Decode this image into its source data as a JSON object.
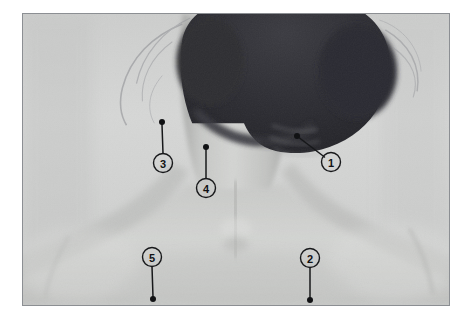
{
  "figure": {
    "kind": "anatomy-photo",
    "frame": {
      "x": 22,
      "y": 13,
      "width": 428,
      "height": 293,
      "border_color": "#8c8f93"
    },
    "background_color": "#ffffff"
  },
  "photo": {
    "name": "posterior-neck-shoulders",
    "palette": {
      "skin_light": "#d8d9d8",
      "skin_mid": "#c6c7c6",
      "skin_shadow": "#a9aaa9",
      "hair_dark": "#2a2a2e",
      "hair_mid": "#44444a",
      "background_wall": "#d4d5d4",
      "marker_ink": "#111214"
    }
  },
  "markers": [
    {
      "id": "marker-1",
      "label": "1",
      "circle": {
        "cx": 331,
        "cy": 162,
        "r": 9.5
      },
      "dot": {
        "cx": 297,
        "cy": 136,
        "r": 3.0
      },
      "leader": {
        "x1": 299.5,
        "y1": 138,
        "x2": 324.5,
        "y2": 157
      }
    },
    {
      "id": "marker-2",
      "label": "2",
      "circle": {
        "cx": 310,
        "cy": 258,
        "r": 9.5
      },
      "dot": {
        "cx": 310,
        "cy": 300,
        "r": 3.0
      },
      "leader": {
        "x1": 310,
        "y1": 267.5,
        "x2": 310,
        "y2": 298
      }
    },
    {
      "id": "marker-3",
      "label": "3",
      "circle": {
        "cx": 163,
        "cy": 163,
        "r": 9.5
      },
      "dot": {
        "cx": 162,
        "cy": 122,
        "r": 3.0
      },
      "leader": {
        "x1": 162,
        "y1": 124.5,
        "x2": 163,
        "y2": 153.5
      }
    },
    {
      "id": "marker-4",
      "label": "4",
      "circle": {
        "cx": 206,
        "cy": 188,
        "r": 9.5
      },
      "dot": {
        "cx": 206,
        "cy": 147,
        "r": 3.0
      },
      "leader": {
        "x1": 206,
        "y1": 149.5,
        "x2": 206,
        "y2": 178.5
      }
    },
    {
      "id": "marker-5",
      "label": "5",
      "circle": {
        "cx": 152,
        "cy": 257,
        "r": 9.5
      },
      "dot": {
        "cx": 153,
        "cy": 299,
        "r": 3.0
      },
      "leader": {
        "x1": 152,
        "y1": 266.5,
        "x2": 153,
        "y2": 297
      }
    }
  ]
}
